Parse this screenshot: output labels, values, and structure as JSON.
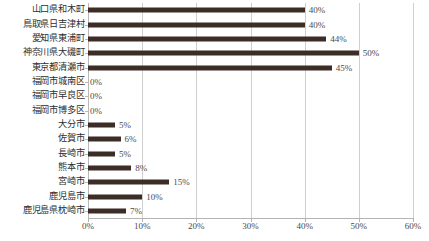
{
  "chart_data": {
    "type": "bar",
    "orientation": "horizontal",
    "title": "",
    "subtitle": "",
    "xlabel": "",
    "ylabel": "",
    "xlim": [
      0,
      60
    ],
    "xticks": [
      0,
      10,
      20,
      30,
      40,
      50,
      60
    ],
    "xtick_labels": [
      "0%",
      "10%",
      "20%",
      "30%",
      "40%",
      "50%",
      "60%"
    ],
    "grid": true,
    "grid_axis": "x",
    "legend": false,
    "legend_position": "none",
    "value_label_suffix": "%",
    "categories": [
      "山口県和木町",
      "鳥取県日吉津村",
      "愛知県東浦町",
      "神奈川県大磯町",
      "東京都清瀬市",
      "福岡市城南区",
      "福岡市早良区",
      "福岡市博多区",
      "大分市",
      "佐賀市",
      "長崎市",
      "熊本市",
      "宮崎市",
      "鹿児島市",
      "鹿児島県枕崎市"
    ],
    "values": [
      40,
      40,
      44,
      50,
      45,
      0,
      0,
      0,
      5,
      6,
      5,
      8,
      15,
      10,
      7
    ],
    "value_labels": [
      "40%",
      "40%",
      "44%",
      "50%",
      "45%",
      "0%",
      "0%",
      "0%",
      "5%",
      "6%",
      "5%",
      "8%",
      "15%",
      "10%",
      "7%"
    ],
    "colors": {
      "bar": "#3c2d26",
      "gridline": "#cfcfcf",
      "axis": "#b3b3b3",
      "text": "#3a3a3a",
      "background": "#ffffff"
    }
  }
}
